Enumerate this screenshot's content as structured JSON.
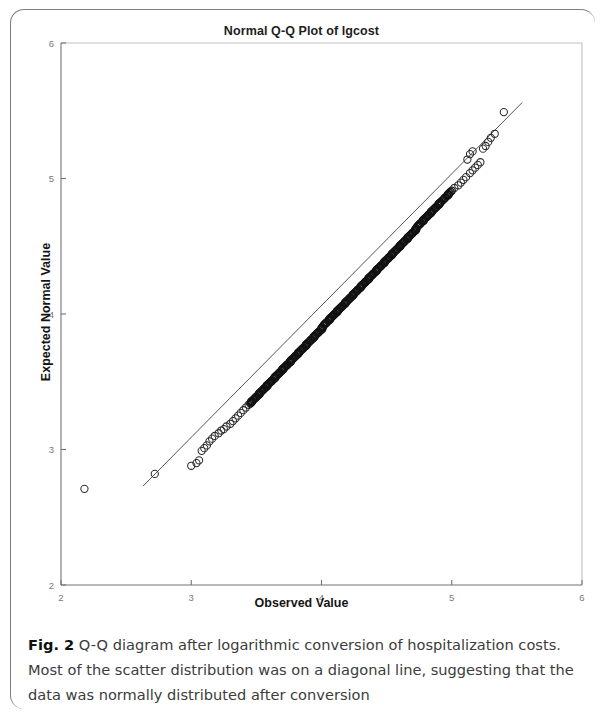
{
  "figure": {
    "label": "Fig. 2",
    "caption": "Q-Q diagram after logarithmic conversion of hospitalization costs. Most of the scatter distribution was on a diagonal line, suggesting that the data was normally distributed after conversion"
  },
  "chart_data": {
    "type": "scatter",
    "title": "Normal Q-Q Plot of lgcost",
    "xlabel": "Observed Value",
    "ylabel": "Expected Normal Value",
    "xlim": [
      2,
      6
    ],
    "ylim": [
      2,
      6
    ],
    "xticks": [
      2,
      3,
      4,
      5,
      6
    ],
    "yticks": [
      2,
      3,
      4,
      5,
      6
    ],
    "xtick_labels": [
      "2",
      "3",
      "4",
      "5",
      "6"
    ],
    "ytick_labels": [
      "2",
      "3",
      "4",
      "5",
      "6"
    ],
    "grid": false,
    "legend": null,
    "marker": "open-circle",
    "reference_line": {
      "label": "diagonal reference line",
      "x": [
        2.63,
        5.54
      ],
      "y": [
        2.73,
        5.56
      ],
      "color": "#52565b"
    },
    "series": [
      {
        "name": "lgcost quantiles",
        "color": "#2b2b2b",
        "points": [
          [
            2.18,
            2.71
          ],
          [
            2.72,
            2.82
          ],
          [
            3.0,
            2.88
          ],
          [
            3.04,
            2.9
          ],
          [
            3.06,
            2.92
          ],
          [
            3.08,
            2.99
          ],
          [
            3.1,
            3.01
          ],
          [
            3.12,
            3.03
          ],
          [
            3.14,
            3.06
          ],
          [
            3.16,
            3.08
          ],
          [
            3.18,
            3.1
          ],
          [
            3.21,
            3.12
          ],
          [
            3.23,
            3.14
          ],
          [
            3.25,
            3.15
          ],
          [
            3.27,
            3.17
          ],
          [
            3.3,
            3.19
          ],
          [
            3.32,
            3.21
          ],
          [
            3.34,
            3.23
          ],
          [
            3.36,
            3.25
          ],
          [
            3.38,
            3.27
          ],
          [
            3.4,
            3.29
          ],
          [
            3.42,
            3.31
          ],
          [
            3.44,
            3.33
          ],
          [
            3.46,
            3.35
          ],
          [
            3.48,
            3.37
          ],
          [
            3.5,
            3.39
          ],
          [
            3.52,
            3.41
          ],
          [
            3.54,
            3.43
          ],
          [
            3.56,
            3.45
          ],
          [
            3.58,
            3.47
          ],
          [
            3.6,
            3.49
          ],
          [
            3.62,
            3.51
          ],
          [
            3.64,
            3.53
          ],
          [
            3.66,
            3.55
          ],
          [
            3.68,
            3.57
          ],
          [
            3.7,
            3.59
          ],
          [
            3.72,
            3.61
          ],
          [
            3.74,
            3.63
          ],
          [
            3.76,
            3.65
          ],
          [
            3.78,
            3.67
          ],
          [
            3.8,
            3.69
          ],
          [
            3.82,
            3.71
          ],
          [
            3.84,
            3.73
          ],
          [
            3.86,
            3.75
          ],
          [
            3.88,
            3.77
          ],
          [
            3.9,
            3.79
          ],
          [
            3.92,
            3.81
          ],
          [
            3.94,
            3.83
          ],
          [
            3.96,
            3.85
          ],
          [
            3.98,
            3.87
          ],
          [
            4.0,
            3.89
          ],
          [
            4.02,
            3.92
          ],
          [
            4.04,
            3.94
          ],
          [
            4.06,
            3.96
          ],
          [
            4.08,
            3.98
          ],
          [
            4.1,
            4.0
          ],
          [
            4.12,
            4.02
          ],
          [
            4.14,
            4.04
          ],
          [
            4.16,
            4.06
          ],
          [
            4.18,
            4.08
          ],
          [
            4.2,
            4.1
          ],
          [
            4.22,
            4.12
          ],
          [
            4.24,
            4.14
          ],
          [
            4.26,
            4.16
          ],
          [
            4.28,
            4.18
          ],
          [
            4.3,
            4.2
          ],
          [
            4.32,
            4.22
          ],
          [
            4.34,
            4.24
          ],
          [
            4.36,
            4.26
          ],
          [
            4.38,
            4.28
          ],
          [
            4.4,
            4.3
          ],
          [
            4.42,
            4.32
          ],
          [
            4.44,
            4.34
          ],
          [
            4.46,
            4.36
          ],
          [
            4.48,
            4.38
          ],
          [
            4.5,
            4.4
          ],
          [
            4.52,
            4.42
          ],
          [
            4.54,
            4.44
          ],
          [
            4.56,
            4.46
          ],
          [
            4.58,
            4.48
          ],
          [
            4.6,
            4.5
          ],
          [
            4.62,
            4.52
          ],
          [
            4.64,
            4.54
          ],
          [
            4.66,
            4.56
          ],
          [
            4.68,
            4.58
          ],
          [
            4.7,
            4.6
          ],
          [
            4.72,
            4.62
          ],
          [
            4.74,
            4.65
          ],
          [
            4.76,
            4.67
          ],
          [
            4.78,
            4.69
          ],
          [
            4.8,
            4.71
          ],
          [
            4.82,
            4.73
          ],
          [
            4.84,
            4.75
          ],
          [
            4.86,
            4.77
          ],
          [
            4.88,
            4.79
          ],
          [
            4.9,
            4.81
          ],
          [
            4.92,
            4.83
          ],
          [
            4.95,
            4.86
          ],
          [
            4.97,
            4.88
          ],
          [
            5.0,
            4.91
          ],
          [
            5.02,
            4.93
          ],
          [
            5.05,
            4.95
          ],
          [
            5.07,
            4.97
          ],
          [
            5.09,
            4.99
          ],
          [
            5.11,
            5.01
          ],
          [
            5.14,
            5.04
          ],
          [
            5.16,
            5.06
          ],
          [
            5.18,
            5.08
          ],
          [
            5.2,
            5.1
          ],
          [
            5.22,
            5.12
          ],
          [
            5.12,
            5.14
          ],
          [
            5.14,
            5.18
          ],
          [
            5.16,
            5.2
          ],
          [
            5.24,
            5.22
          ],
          [
            5.26,
            5.24
          ],
          [
            5.28,
            5.27
          ],
          [
            5.3,
            5.3
          ],
          [
            5.33,
            5.33
          ],
          [
            5.4,
            5.49
          ]
        ]
      }
    ],
    "annotations": [
      {
        "text": "low outlier",
        "x": 2.18,
        "y": 2.71
      },
      {
        "text": "upper-tail point above line",
        "x": 5.4,
        "y": 5.49
      }
    ]
  }
}
